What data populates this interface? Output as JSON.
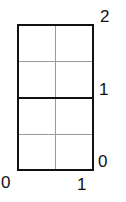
{
  "diagram": {
    "labels": {
      "x_origin": "0",
      "x_one": "1",
      "y_zero": "0",
      "y_one": "1",
      "y_two": "2"
    },
    "colors": {
      "outline": "#111111",
      "grid": "#999999"
    }
  }
}
